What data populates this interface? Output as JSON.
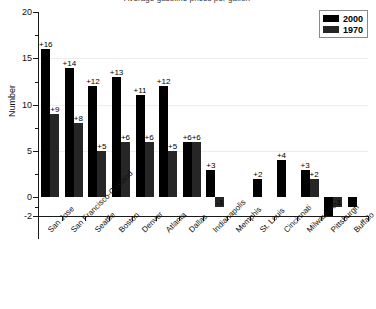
{
  "chart_data": {
    "type": "bar",
    "title": "Average gasoline prices per gallon",
    "xlabel": "",
    "ylabel": "Number",
    "ylim": [
      -2,
      20
    ],
    "yticks": [
      20,
      15,
      10,
      5,
      0,
      -2
    ],
    "ytick_labels": [
      "20",
      "15",
      "10",
      "5",
      "0",
      "-2"
    ],
    "grid": true,
    "legend_position": "top-right",
    "categories": [
      "San Jose",
      "San Francisco-Oakland",
      "Seattle",
      "Boston",
      "Denver",
      "Atlanta",
      "Dallas",
      "Indianapolis",
      "Memphis",
      "St. Louis",
      "Cincinnati",
      "Milwaukee",
      "Pittsburgh",
      "Buffalo"
    ],
    "series": [
      {
        "name": "2000",
        "color": "#000000",
        "values": [
          16,
          14,
          12,
          13,
          11,
          12,
          6,
          3,
          null,
          2,
          4,
          3,
          -2,
          -1
        ],
        "labels": [
          "+16",
          "+14",
          "+12",
          "+13",
          "+11",
          "+12",
          "+6",
          "+3",
          "",
          "+2",
          "+4",
          "+3",
          "-2",
          "-1"
        ]
      },
      {
        "name": "1970",
        "color": "#262626",
        "values": [
          9,
          8,
          5,
          6,
          6,
          5,
          6,
          -1,
          null,
          null,
          null,
          2,
          -1,
          null
        ],
        "labels": [
          "+9",
          "+8",
          "+5",
          "+6",
          "+6",
          "+5",
          "+6",
          "-1",
          "",
          "",
          "",
          "+2",
          "-1",
          ""
        ]
      }
    ]
  },
  "legend": {
    "items": [
      {
        "label": "2000",
        "color": "#000000"
      },
      {
        "label": "1970",
        "color": "#262626"
      }
    ]
  }
}
